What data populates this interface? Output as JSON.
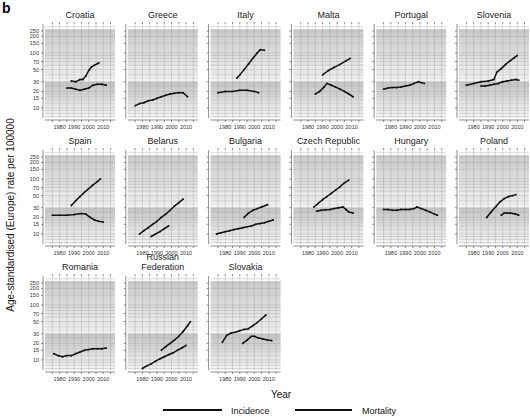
{
  "figure": {
    "letter": "b",
    "xlabel": "Year",
    "ylabel": "Age-standardised (Europe) rate per 100000"
  },
  "legend": [
    {
      "label": "Incidence",
      "color": "#111111"
    },
    {
      "label": "Mortality",
      "color": "#111111"
    }
  ],
  "chart_data": {
    "type": "line",
    "title": "",
    "xlabel": "Year",
    "ylabel": "Age-standardised (Europe) rate per 100000",
    "yscale": "log",
    "ylim": [
      5,
      300
    ],
    "xlim": [
      1972,
      2016
    ],
    "y_ticks": [
      10,
      15,
      20,
      30,
      50,
      70,
      100,
      150,
      200,
      250
    ],
    "x_ticks": [
      1980,
      1990,
      2000,
      2010
    ],
    "grid": true,
    "shaded_bands": [
      {
        "from": 30,
        "to": 300,
        "description": "upper gray band fading downward"
      },
      {
        "from": 5,
        "to": 30,
        "description": "lower gray band fading downward"
      }
    ],
    "legend_position": "bottom",
    "panels": [
      {
        "name": "Croatia",
        "series": [
          {
            "name": "Incidence",
            "x": [
              1988,
              1991,
              1994,
              1996,
              1998,
              2000,
              2002,
              2004,
              2006,
              2007
            ],
            "values": [
              31,
              30,
              33,
              33,
              38,
              48,
              56,
              60,
              64,
              66
            ]
          },
          {
            "name": "Mortality",
            "x": [
              1985,
              1988,
              1991,
              1994,
              1997,
              2000,
              2003,
              2006,
              2009,
              2012
            ],
            "values": [
              23,
              23,
              22,
              21,
              22,
              23,
              26,
              27,
              27,
              26
            ]
          }
        ]
      },
      {
        "name": "Greece",
        "series": [
          {
            "name": "Mortality",
            "x": [
              1975,
              1978,
              1981,
              1984,
              1987,
              1990,
              1993,
              1996,
              1999,
              2002,
              2005,
              2008,
              2011
            ],
            "values": [
              11,
              12,
              12.5,
              13.5,
              14,
              15,
              16,
              17,
              18,
              18.5,
              19,
              19,
              16
            ]
          }
        ]
      },
      {
        "name": "Italy",
        "series": [
          {
            "name": "Incidence",
            "x": [
              1988,
              1990,
              1993,
              1996,
              1999,
              2002,
              2004,
              2007
            ],
            "values": [
              35,
              40,
              50,
              63,
              80,
              100,
              115,
              112
            ]
          },
          {
            "name": "Mortality",
            "x": [
              1975,
              1980,
              1985,
              1990,
              1995,
              2000,
              2003
            ],
            "values": [
              19,
              20,
              20,
              21,
              21,
              20,
              19
            ]
          }
        ]
      },
      {
        "name": "Malta",
        "series": [
          {
            "name": "Incidence",
            "x": [
              1990,
              1994,
              1998,
              2002,
              2006,
              2009
            ],
            "values": [
              40,
              48,
              55,
              62,
              72,
              80
            ]
          },
          {
            "name": "Mortality",
            "x": [
              1985,
              1988,
              1991,
              1993,
              1996,
              1999,
              2002,
              2005,
              2008,
              2011
            ],
            "values": [
              18,
              20,
              24,
              28,
              26,
              24,
              22,
              20,
              18,
              16
            ]
          }
        ]
      },
      {
        "name": "Portugal",
        "series": [
          {
            "name": "Mortality",
            "x": [
              1975,
              1978,
              1981,
              1984,
              1987,
              1990,
              1993,
              1996,
              1999,
              2001,
              2003
            ],
            "values": [
              22,
              23,
              23.5,
              23.5,
              24,
              25,
              26,
              28,
              30,
              29,
              28
            ]
          }
        ]
      },
      {
        "name": "Slovenia",
        "series": [
          {
            "name": "Incidence",
            "x": [
              1975,
              1980,
              1985,
              1990,
              1994,
              1996,
              1999,
              2002,
              2005,
              2008,
              2010
            ],
            "values": [
              26,
              28,
              30,
              31,
              33,
              45,
              52,
              62,
              72,
              82,
              90
            ]
          },
          {
            "name": "Mortality",
            "x": [
              1985,
              1988,
              1991,
              1994,
              1997,
              2000,
              2003,
              2006,
              2009,
              2011
            ],
            "values": [
              25,
              25,
              26,
              27,
              28,
              30,
              31,
              32,
              33,
              32
            ]
          }
        ]
      },
      {
        "name": "Spain",
        "series": [
          {
            "name": "Incidence",
            "x": [
              1988,
              1991,
              1994,
              1997,
              2000,
              2003,
              2006,
              2008
            ],
            "values": [
              33,
              40,
              48,
              57,
              67,
              78,
              90,
              100
            ]
          },
          {
            "name": "Mortality",
            "x": [
              1975,
              1980,
              1985,
              1990,
              1995,
              1998,
              2001,
              2004,
              2007,
              2010
            ],
            "values": [
              22,
              22,
              22,
              22.5,
              23.5,
              23,
              20,
              18,
              17,
              16.5
            ]
          }
        ]
      },
      {
        "name": "Belarus",
        "series": [
          {
            "name": "Incidence",
            "x": [
              1978,
              1981,
              1984,
              1987,
              1990,
              1993,
              1996,
              1999,
              2002,
              2005,
              2008
            ],
            "values": [
              10,
              11.5,
              13,
              15,
              17,
              20,
              23,
              27,
              32,
              37,
              43
            ]
          },
          {
            "name": "Mortality",
            "x": [
              1986,
              1989,
              1992,
              1995,
              1998
            ],
            "values": [
              9,
              10,
              11,
              12.5,
              14
            ]
          }
        ]
      },
      {
        "name": "Bulgaria",
        "series": [
          {
            "name": "Incidence",
            "x": [
              1993,
              1996,
              1999,
              2002,
              2005,
              2009
            ],
            "values": [
              20,
              24,
              27,
              29,
              31,
              34
            ]
          },
          {
            "name": "Mortality",
            "x": [
              1974,
              1977,
              1980,
              1983,
              1986,
              1989,
              1992,
              1995,
              1998,
              2001,
              2004,
              2007,
              2010,
              2013
            ],
            "values": [
              10,
              10.5,
              11,
              11.5,
              12,
              12.5,
              13,
              13.5,
              14,
              15,
              15.5,
              16,
              17,
              18
            ]
          }
        ]
      },
      {
        "name": "Czech Republic",
        "series": [
          {
            "name": "Incidence",
            "x": [
              1984,
              1987,
              1990,
              1993,
              1996,
              1999,
              2002,
              2005,
              2008
            ],
            "values": [
              31,
              36,
              42,
              48,
              55,
              63,
              72,
              85,
              95
            ]
          },
          {
            "name": "Mortality",
            "x": [
              1986,
              1989,
              1992,
              1995,
              1998,
              2001,
              2004,
              2006,
              2008,
              2011
            ],
            "values": [
              26,
              27,
              27.5,
              28,
              29,
              30,
              31,
              28,
              25,
              24
            ]
          }
        ]
      },
      {
        "name": "Hungary",
        "series": [
          {
            "name": "Mortality",
            "x": [
              1975,
              1978,
              1981,
              1984,
              1987,
              1990,
              1993,
              1996,
              1998,
              2001,
              2004,
              2007,
              2010,
              2012
            ],
            "values": [
              28,
              28,
              27,
              27,
              28,
              28,
              28,
              29,
              31,
              29,
              27,
              25,
              23,
              22
            ]
          }
        ]
      },
      {
        "name": "Poland",
        "series": [
          {
            "name": "Incidence",
            "x": [
              1989,
              1992,
              1995,
              1998,
              2001,
              2004,
              2007,
              2009
            ],
            "values": [
              20,
              25,
              31,
              38,
              44,
              48,
              50,
              52
            ]
          },
          {
            "name": "Mortality",
            "x": [
              1999,
              2001,
              2003,
              2005,
              2007,
              2009,
              2011
            ],
            "values": [
              22,
              24,
              24,
              24,
              23.5,
              23,
              22
            ]
          }
        ]
      },
      {
        "name": "Romania",
        "series": [
          {
            "name": "Mortality",
            "x": [
              1976,
              1979,
              1982,
              1985,
              1988,
              1991,
              1994,
              1997,
              2000,
              2003,
              2006,
              2009,
              2012
            ],
            "values": [
              13,
              12,
              11.5,
              12,
              12,
              13,
              14,
              15,
              15.5,
              16,
              16,
              16,
              16.5
            ]
          }
        ]
      },
      {
        "name": "Russian Federation",
        "series": [
          {
            "name": "Incidence",
            "x": [
              1993,
              1996,
              1999,
              2002,
              2005,
              2008,
              2011,
              2013
            ],
            "values": [
              15,
              17.5,
              20,
              23,
              27,
              33,
              42,
              50
            ]
          },
          {
            "name": "Mortality",
            "x": [
              1980,
              1983,
              1986,
              1989,
              1992,
              1995,
              1998,
              2001,
              2004,
              2007,
              2010
            ],
            "values": [
              7,
              7.8,
              8.5,
              9.5,
              10.5,
              11.5,
              12.5,
              13.5,
              15,
              16.5,
              18.5
            ]
          }
        ]
      },
      {
        "name": "Slovakia",
        "series": [
          {
            "name": "Incidence",
            "x": [
              1978,
              1981,
              1984,
              1987,
              1990,
              1993,
              1996,
              1999,
              2002,
              2005,
              2008
            ],
            "values": [
              21,
              28,
              31,
              32,
              34,
              36,
              37,
              42,
              48,
              56,
              66
            ]
          },
          {
            "name": "Mortality",
            "x": [
              1992,
              1995,
              1998,
              2000,
              2003,
              2006,
              2009,
              2012
            ],
            "values": [
              20,
              23,
              27,
              27,
              25,
              24,
              23,
              22.5
            ]
          }
        ]
      }
    ]
  }
}
